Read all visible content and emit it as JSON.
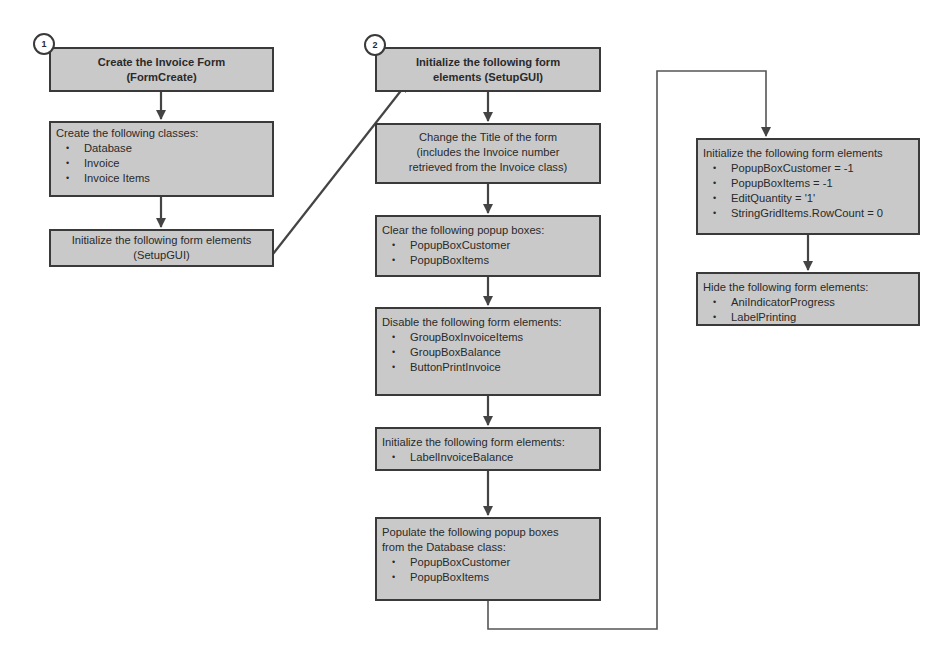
{
  "diagram": {
    "type": "flowchart",
    "colors": {
      "box_fill": "#c9c9c9",
      "border": "#3a3a3a",
      "connector": "#444444"
    },
    "column1": {
      "step_number": "1",
      "boxes": [
        {
          "id": "A",
          "title": "Create the Invoice Form",
          "subtitle": "(FormCreate)"
        },
        {
          "id": "B",
          "heading": "Create the following classes:",
          "items": [
            "Database",
            "Invoice",
            "Invoice Items"
          ]
        },
        {
          "id": "C",
          "title": "Initialize the following form elements",
          "subtitle": "(SetupGUI)"
        }
      ]
    },
    "column2": {
      "step_number": "2",
      "boxes": [
        {
          "id": "D",
          "title": "Initialize the following form",
          "subtitle": "elements (SetupGUI)"
        },
        {
          "id": "E",
          "lines": [
            "Change the Title of the form",
            "(includes the Invoice number",
            "retrieved from the Invoice class)"
          ]
        },
        {
          "id": "F",
          "heading": "Clear the following popup boxes:",
          "items": [
            "PopupBoxCustomer",
            "PopupBoxItems"
          ]
        },
        {
          "id": "G",
          "heading": "Disable the following form elements:",
          "items": [
            "GroupBoxInvoiceItems",
            "GroupBoxBalance",
            "ButtonPrintInvoice"
          ]
        },
        {
          "id": "H",
          "heading": "Initialize the following form elements:",
          "items": [
            "LabelInvoiceBalance"
          ]
        },
        {
          "id": "I",
          "heading": "Populate the following popup boxes",
          "heading2": "from the Database class:",
          "items": [
            "PopupBoxCustomer",
            "PopupBoxItems"
          ]
        }
      ]
    },
    "column3": {
      "boxes": [
        {
          "id": "J",
          "heading": "Initialize the following form elements",
          "items": [
            "PopupBoxCustomer = -1",
            "PopupBoxItems = -1",
            "EditQuantity = '1'",
            "StringGridItems.RowCount = 0"
          ]
        },
        {
          "id": "K",
          "heading": "Hide the following form elements:",
          "items": [
            "AniIndicatorProgress",
            "LabelPrinting"
          ]
        }
      ]
    }
  }
}
